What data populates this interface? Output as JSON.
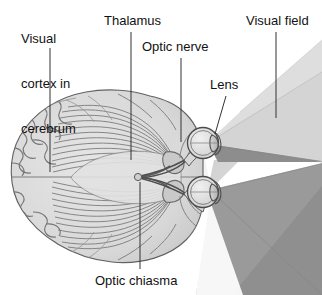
{
  "figure": {
    "view": "transverse (horizontal) section of the human brain with eyes and visual fields",
    "background_color": "#ffffff",
    "text_color": "#111111",
    "leader_line_color": "#333333"
  },
  "labels": {
    "visual_cortex": {
      "line1": "Visual",
      "line2": "cortex in",
      "line3": "cerebrum",
      "full": "Visual cortex in cerebrum"
    },
    "thalamus": "Thalamus",
    "optic_nerve": "Optic nerve",
    "lens": "Lens",
    "visual_field": "Visual field",
    "optic_chiasma": "Optic chiasma"
  },
  "anatomy": {
    "structures": [
      "cerebrum",
      "occipital visual cortex",
      "optic radiation fibers",
      "thalamus (lateral geniculate nucleus)",
      "optic tract",
      "optic chiasma",
      "optic nerve",
      "eyeball",
      "lens",
      "retina"
    ],
    "brain_fill": "#dcdcdc",
    "brain_outline": "#5c5c5c",
    "fiber_color": "#6e6e6e",
    "eye_fill": "#e8e8e8",
    "eye_outline": "#4a4a4a",
    "lens_fill": "#c4c4c4"
  },
  "visual_field": {
    "description": "Overlapping binocular visual field cones projecting from each eye",
    "regions": [
      {
        "name": "upper-monocular-field",
        "color": "#d7d7d7"
      },
      {
        "name": "binocular-overlap-upper",
        "color": "#8d8d8d"
      },
      {
        "name": "binocular-overlap-lower",
        "color": "#9b9b9b"
      },
      {
        "name": "lower-monocular-field",
        "color": "#9a9a9a"
      },
      {
        "name": "near-blind-zone",
        "color": "#f3f3f3"
      }
    ]
  }
}
